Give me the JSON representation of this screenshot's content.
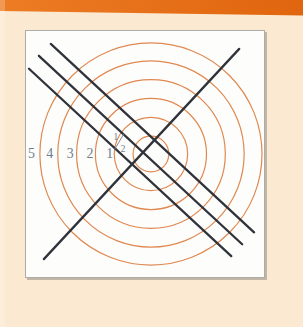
{
  "page": {
    "background": "#fbe9d1",
    "edge_highlight": true
  },
  "header_bar": {
    "color_left": "#ec7c25",
    "color_right": "#e0650e"
  },
  "figure": {
    "panel": {
      "x": 25,
      "y": 30,
      "width": 240,
      "height": 248,
      "background": "#fdfdfc",
      "border_color": "#adaca6"
    },
    "circles": {
      "center": {
        "x": 126,
        "y": 124
      },
      "radii": [
        18,
        37,
        56,
        75,
        94,
        112
      ],
      "stroke_color": "#e08850",
      "stroke_width": 1.2
    },
    "lines": {
      "stroke_color": "#30333a",
      "stroke_width": 2.3,
      "parallel": [
        {
          "x1": 25,
          "y1": 13,
          "x2": 230,
          "y2": 203
        },
        {
          "x1": 13,
          "y1": 25,
          "x2": 218,
          "y2": 215
        },
        {
          "x1": 3,
          "y1": 38,
          "x2": 207,
          "y2": 227
        }
      ],
      "transversal": {
        "x1": 18,
        "y1": 230,
        "x2": 215,
        "y2": 18
      }
    },
    "labels": {
      "color": "#6e7e8e",
      "font_size": 14,
      "items": [
        {
          "text": "5",
          "x": 5.5,
          "y": 124
        },
        {
          "text": "4",
          "x": 24,
          "y": 124
        },
        {
          "text": "3",
          "x": 44.5,
          "y": 124
        },
        {
          "text": "2",
          "x": 64.5,
          "y": 124
        },
        {
          "text": "1",
          "x": 84.5,
          "y": 124
        }
      ],
      "fraction": {
        "numerator": "1",
        "denominator": "2",
        "x": 94,
        "y": 112,
        "font_size": 9.5
      }
    }
  }
}
